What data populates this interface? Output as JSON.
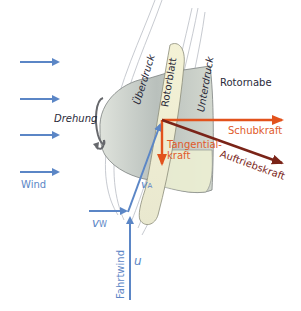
{
  "diagram": {
    "type": "wind-turbine-rotor-force-diagram",
    "colors": {
      "wind": "#5b86c6",
      "thrust": "#e2521c",
      "lift": "#7a2418",
      "hub_fill": "#c9cfc6",
      "blade_fill": "#f1f0d0",
      "streamline": "#b9bcc4",
      "text_dark": "#2a2a3a"
    },
    "labels": {
      "ueberdruck": "Überdruck",
      "rotorblatt": "Rotorblatt",
      "unterdruck": "Unterdruck",
      "rotornabe": "Rotornabe",
      "drehung": "Drehung",
      "wind": "Wind",
      "schubkraft": "Schubkraft",
      "tangentialkraft_line1": "Tangential-",
      "tangentialkraft_line2": "kraft",
      "auftriebskraft": "Auftriebskraft",
      "v_a": "v",
      "v_a_sub": "A",
      "v_w": "v",
      "v_w_sub": "W",
      "u": "u",
      "fahrtwind": "Fahrtwind"
    },
    "wind_arrows_count": 4
  }
}
